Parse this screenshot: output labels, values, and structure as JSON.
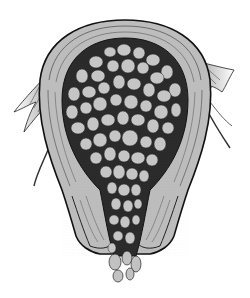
{
  "figure": {
    "colors": {
      "fill": "#bdbdbd",
      "vesicle": "#c4c4c4",
      "ink": "#1a1a1a",
      "background": "#ffffff"
    },
    "caption": ""
  }
}
